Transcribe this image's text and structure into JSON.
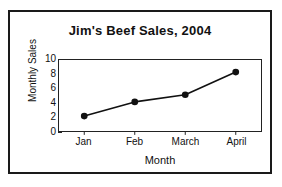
{
  "chart_data": {
    "type": "line",
    "title": "Jim's Beef Sales, 2004",
    "xlabel": "Month",
    "ylabel": "Monthly Sales",
    "categories": [
      "Jan",
      "Feb",
      "March",
      "April"
    ],
    "values": [
      2.1,
      4.1,
      5.1,
      8.3
    ],
    "ylim": [
      0,
      10
    ],
    "yticks": [
      0,
      2,
      4,
      6,
      8,
      10
    ],
    "ytick_labels": [
      "0",
      "2",
      "4",
      "6",
      "8",
      "10"
    ],
    "grid": false,
    "legend": null,
    "marker": "filled-circle",
    "line_color": "#111111",
    "marker_color": "#111111",
    "frame_color": "#222222",
    "background_color": "#ffffff",
    "border_color": "#1a1a1a"
  }
}
